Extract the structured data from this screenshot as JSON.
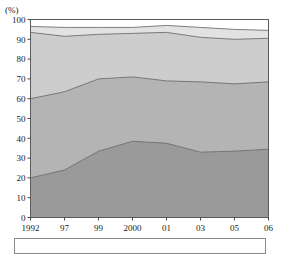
{
  "chart_data": {
    "type": "area",
    "stacked": true,
    "title": "",
    "subtitle": "",
    "xlabel": "",
    "ylabel": "",
    "unit_label": "(%)",
    "ylim": [
      0,
      100
    ],
    "yticks": [
      0,
      10,
      20,
      30,
      40,
      50,
      60,
      70,
      80,
      90,
      100
    ],
    "ytick_labels": [
      "0",
      "10",
      "20",
      "30",
      "40",
      "50",
      "60",
      "70",
      "80",
      "90",
      "100"
    ],
    "grid": false,
    "legend_position": "bottom",
    "legend_clipped": true,
    "categories": [
      "1992",
      "97",
      "99",
      "2000",
      "01",
      "03",
      "05",
      "06"
    ],
    "xtick_labels": [
      "1992",
      "97",
      "99",
      "2000",
      "01",
      "03",
      "05",
      "06"
    ],
    "series": [
      {
        "name": "series-1",
        "color": "#9a9a9a",
        "values": [
          20.0,
          24.0,
          33.5,
          38.5,
          37.5,
          33.0,
          33.5,
          34.5
        ],
        "cumulative": [
          20.0,
          24.0,
          33.5,
          38.5,
          37.5,
          33.0,
          33.5,
          34.5
        ]
      },
      {
        "name": "series-2",
        "color": "#b4b4b4",
        "values": [
          40.0,
          39.5,
          36.5,
          32.5,
          31.5,
          35.5,
          34.0,
          34.0
        ],
        "cumulative": [
          60.0,
          63.5,
          70.0,
          71.0,
          69.0,
          68.5,
          67.5,
          68.5
        ]
      },
      {
        "name": "series-3",
        "color": "#cdcdcd",
        "values": [
          33.5,
          28.0,
          22.5,
          22.0,
          24.5,
          22.5,
          22.5,
          22.0
        ],
        "cumulative": [
          93.5,
          91.5,
          92.5,
          93.0,
          93.5,
          91.0,
          90.0,
          90.5
        ]
      },
      {
        "name": "series-4",
        "color": "#e2e2e2",
        "values": [
          3.0,
          4.5,
          3.5,
          3.0,
          3.5,
          5.0,
          5.0,
          4.0
        ],
        "cumulative": [
          96.5,
          96.0,
          96.0,
          96.0,
          97.0,
          96.0,
          95.0,
          94.5
        ]
      },
      {
        "name": "series-5",
        "color": "#ffffff",
        "values": [
          3.5,
          4.0,
          4.0,
          4.0,
          3.0,
          4.0,
          5.0,
          5.5
        ],
        "cumulative": [
          100.0,
          100.0,
          100.0,
          100.0,
          100.0,
          100.0,
          100.0,
          100.0
        ]
      }
    ]
  },
  "colors": {
    "axis": "#4a4a4a",
    "boundary": "#6f6f6f",
    "text": "#1a1a1a",
    "plot_border": "#5a5a5a"
  },
  "legend": {
    "entries": []
  }
}
